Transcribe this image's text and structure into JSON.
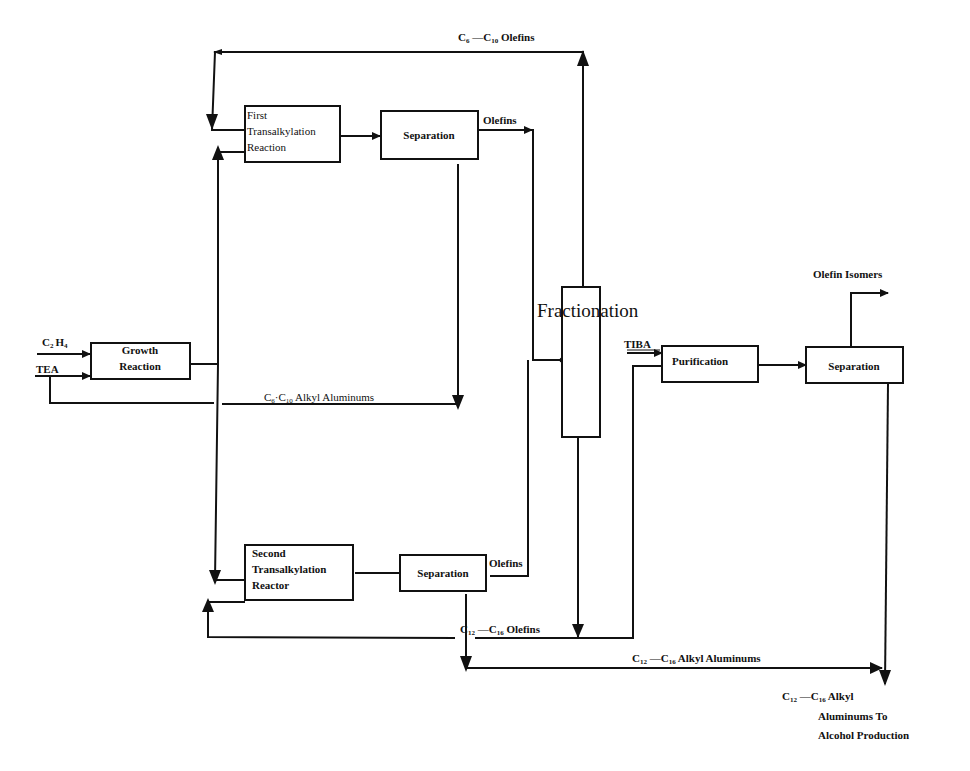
{
  "diagram": {
    "colors": {
      "line": "#111111",
      "background": "#ffffff"
    },
    "nodes": {
      "growth_reaction": {
        "line1": "Growth",
        "line2": "Reaction"
      },
      "first_transalkylation": {
        "line1": "First",
        "line2": "Transalkylation",
        "line3": "Reaction"
      },
      "separation_1": {
        "label": "Separation"
      },
      "fractionation": {
        "label": "Fractionation"
      },
      "second_transalkylation": {
        "line1": "Second",
        "line2": "Transalkylation",
        "line3": "Reactor"
      },
      "separation_2": {
        "label": "Separation"
      },
      "purification": {
        "label": "Purification"
      },
      "separation_3": {
        "label": "Separation"
      }
    },
    "streams": {
      "c2h4": {
        "main": "C",
        "sub1": "2",
        "mid": "H",
        "sub2": "4"
      },
      "tea": {
        "label": "TEA"
      },
      "tiba": {
        "label": "TIBA"
      },
      "c6_c10_olefins": {
        "c1": "C",
        "s1": "6",
        "dash": " —C",
        "s2": "10",
        "tail": " Olefins"
      },
      "olefins_1": {
        "label": "Olefins"
      },
      "c6_c10_alkyl": {
        "c1": "C",
        "s1": "6",
        "dash": "·C",
        "s2": "10",
        "tail": "  Alkyl Aluminums"
      },
      "olefins_2": {
        "label": "Olefins"
      },
      "c12_c16_olefins": {
        "c1": "C",
        "s1": "12",
        "dash": " —C",
        "s2": "16",
        "tail": " Olefins"
      },
      "c12_c16_alkyl": {
        "c1": "C",
        "s1": "12",
        "dash": " —C",
        "s2": "16",
        "tail": " Alkyl Aluminums"
      },
      "olefin_isomers": {
        "label": "Olefin Isomers"
      },
      "product": {
        "c1": "C",
        "s1": "12",
        "dash": " —C",
        "s2": "16",
        "tail": " Alkyl",
        "line2": "Aluminums To",
        "line3": "Alcohol Production"
      }
    }
  }
}
